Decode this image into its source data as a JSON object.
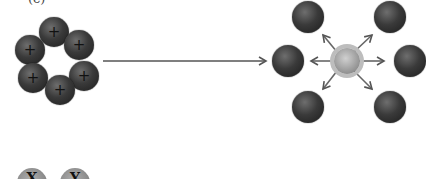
{
  "panel_label_fragment": "(c)",
  "ring_cluster": {
    "charge_label": "+",
    "count": 6
  },
  "transition_arrow": {
    "direction": "right"
  },
  "dispersed": {
    "outer_count": 6,
    "arrow_count": 6
  },
  "bottom_row": {
    "labels": [
      "X",
      "Y"
    ]
  },
  "colors": {
    "ball": "#2a2a2a",
    "center": "#a0a0a0",
    "arrow": "#555555",
    "bottom_ball": "#8a8a8a"
  }
}
